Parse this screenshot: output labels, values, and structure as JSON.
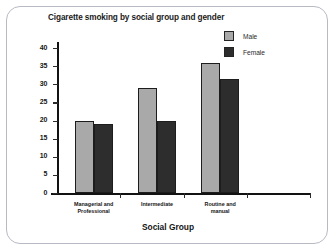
{
  "chart_data": {
    "type": "bar",
    "title": "Cigarette smoking by social group and gender",
    "xlabel": "Social Group",
    "ylabel": "",
    "categories": [
      "Managerial and Professional",
      "Intermediate",
      "Routine and manual"
    ],
    "series": [
      {
        "name": "Male",
        "values": [
          20,
          29,
          36
        ],
        "color": "#a9a9a9"
      },
      {
        "name": "Female",
        "values": [
          19,
          20,
          31.5
        ],
        "color": "#2d2d2d"
      }
    ],
    "ylim": [
      0,
      40
    ],
    "yticks": [
      0,
      5,
      10,
      15,
      20,
      25,
      30,
      35,
      40
    ],
    "ytick_labels": [
      "0",
      "5",
      "10",
      "15",
      "20",
      "25",
      "30",
      "35",
      "40"
    ],
    "grid": false,
    "legend_position": "top-right"
  },
  "category_lines": [
    [
      "Managerial and",
      "Professional"
    ],
    [
      "Intermediate",
      ""
    ],
    [
      "Routine and",
      "manual"
    ]
  ],
  "frame": {
    "border_color": "#b9b9c4",
    "background": "#ffffff"
  },
  "axis": {
    "color": "#121212"
  }
}
